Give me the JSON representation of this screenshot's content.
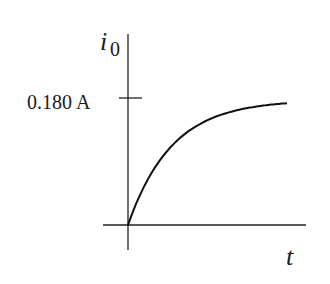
{
  "chart_data": {
    "type": "line",
    "title": "",
    "xlabel": "t",
    "ylabel": "i",
    "ylabel_subscript": "0",
    "y_ticks": [
      {
        "value": 0.18,
        "label": "0.180 A"
      }
    ],
    "series": [
      {
        "name": "i0(t)",
        "description": "Exponential rise from 0 approaching 0.180 A asymptote",
        "x": [
          0,
          0.5,
          1,
          1.5,
          2,
          2.5,
          3,
          3.5,
          4
        ],
        "values": [
          0,
          0.071,
          0.114,
          0.14,
          0.156,
          0.165,
          0.171,
          0.174,
          0.176
        ]
      }
    ],
    "asymptote": 0.18,
    "grid": false,
    "legend": null
  },
  "labels": {
    "y_axis_main": "i",
    "y_axis_sub": "0",
    "x_axis": "t",
    "tick_label": "0.180 A"
  }
}
